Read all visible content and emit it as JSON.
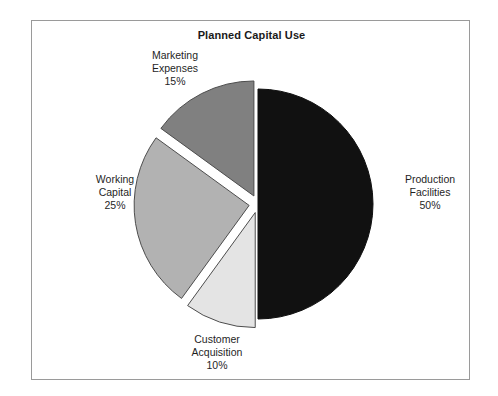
{
  "chart_data": {
    "type": "pie",
    "title": "Planned Capital Use",
    "xlabel": "",
    "ylabel": "",
    "legend_position": "none",
    "grid": false,
    "categories": [
      "Production Facilities",
      "Working Capital",
      "Marketing Expenses",
      "Customer Acquisition"
    ],
    "values": [
      50,
      25,
      15,
      10
    ],
    "value_unit": "%",
    "slices": [
      {
        "label": "Production Facilities",
        "label_line1": "Production",
        "label_line2": "Facilities",
        "value": 50,
        "percent_text": "50%",
        "color": "#111111",
        "start_angle_deg": 0,
        "end_angle_deg": 180,
        "exploded": false
      },
      {
        "label": "Customer Acquisition",
        "label_line1": "Customer",
        "label_line2": "Acquisition",
        "value": 10,
        "percent_text": "10%",
        "color": "#e4e4e4",
        "start_angle_deg": 180,
        "end_angle_deg": 216,
        "exploded": true
      },
      {
        "label": "Working Capital",
        "label_line1": "Working",
        "label_line2": "Capital",
        "value": 25,
        "percent_text": "25%",
        "color": "#b2b2b2",
        "start_angle_deg": 216,
        "end_angle_deg": 306,
        "exploded": true
      },
      {
        "label": "Marketing Expenses",
        "label_line1": "Marketing",
        "label_line2": "Expenses",
        "value": 15,
        "percent_text": "15%",
        "color": "#808080",
        "start_angle_deg": 306,
        "end_angle_deg": 360,
        "exploded": true
      }
    ],
    "colors": {
      "production": "#111111",
      "working": "#b2b2b2",
      "marketing": "#808080",
      "customer": "#e4e4e4",
      "outline": "#4d4d4d",
      "frame": "#9a9a9a",
      "background": "#ffffff",
      "text": "#1f1f1f"
    }
  }
}
